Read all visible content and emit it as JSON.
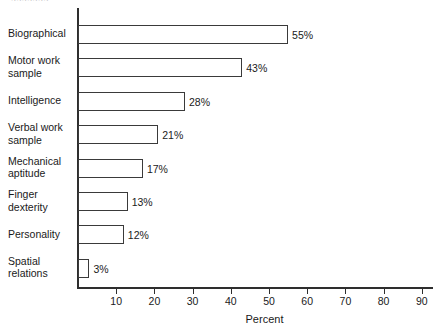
{
  "clipped_header_text": "aaaaaaa",
  "chart_data": {
    "type": "bar",
    "orientation": "horizontal",
    "title": "",
    "xlabel": "Percent",
    "ylabel": "",
    "xlim": [
      0,
      94
    ],
    "xticks": [
      10,
      20,
      30,
      40,
      50,
      60,
      70,
      80,
      90
    ],
    "xtick_labels": [
      "10",
      "20",
      "30",
      "40",
      "50",
      "60",
      "70",
      "80",
      "90"
    ],
    "grid": false,
    "legend": null,
    "categories": [
      "Biographical",
      "Motor work sample",
      "Intelligence",
      "Verbal work sample",
      "Mechanical aptitude",
      "Finger dexterity",
      "Personality",
      "Spatial relations"
    ],
    "values": [
      55,
      43,
      28,
      21,
      17,
      13,
      12,
      3
    ],
    "value_labels": [
      "55%",
      "43%",
      "28%",
      "21%",
      "17%",
      "13%",
      "12%",
      "3%"
    ],
    "bars": [
      {
        "label": "Biographical",
        "label_lines": [
          "Biographical"
        ],
        "value": 55,
        "value_label": "55%"
      },
      {
        "label": "Motor work sample",
        "label_lines": [
          "Motor work",
          "sample"
        ],
        "value": 43,
        "value_label": "43%"
      },
      {
        "label": "Intelligence",
        "label_lines": [
          "Intelligence"
        ],
        "value": 28,
        "value_label": "28%"
      },
      {
        "label": "Verbal work sample",
        "label_lines": [
          "Verbal work",
          "sample"
        ],
        "value": 21,
        "value_label": "21%"
      },
      {
        "label": "Mechanical aptitude",
        "label_lines": [
          "Mechanical",
          "aptitude"
        ],
        "value": 17,
        "value_label": "17%"
      },
      {
        "label": "Finger dexterity",
        "label_lines": [
          "Finger",
          "dexterity"
        ],
        "value": 13,
        "value_label": "13%"
      },
      {
        "label": "Personality",
        "label_lines": [
          "Personality"
        ],
        "value": 12,
        "value_label": "12%"
      },
      {
        "label": "Spatial relations",
        "label_lines": [
          "Spatial",
          "relations"
        ],
        "value": 3,
        "value_label": "3%"
      }
    ],
    "colors": {
      "bar_fill": "#ffffff",
      "bar_stroke": "#3a3a3a",
      "axis": "#2e2e2e",
      "text": "#1a1a1a",
      "background": "#ffffff"
    }
  }
}
